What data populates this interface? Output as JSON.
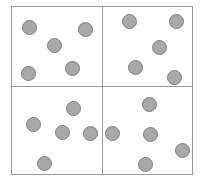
{
  "figure": {
    "title": "",
    "type": "quadrant-dot-diagram",
    "canvas": {
      "width": 204,
      "height": 180,
      "background_color": "#ffffff"
    },
    "frame": {
      "x": 11,
      "y": 6,
      "width": 182,
      "height": 169,
      "border_color": "#9a9a9a",
      "border_width": 1,
      "fill_color": "#ffffff"
    },
    "dividers": {
      "vertical_x": 102,
      "horizontal_y": 86,
      "color": "#9a9a9a",
      "width": 1
    },
    "dot_style": {
      "diameter": 15,
      "fill_color": "#a8a8a8",
      "stroke_color": "#808080",
      "stroke_width": 1
    },
    "total_dot_count": 20,
    "quadrants": [
      {
        "name": "top-left",
        "label": "Q1",
        "dot_count": 5,
        "dots": [
          {
            "cx": 29,
            "cy": 27
          },
          {
            "cx": 85,
            "cy": 29
          },
          {
            "cx": 54,
            "cy": 45
          },
          {
            "cx": 28,
            "cy": 73
          },
          {
            "cx": 72,
            "cy": 68
          }
        ]
      },
      {
        "name": "top-right",
        "label": "Q2",
        "dot_count": 5,
        "dots": [
          {
            "cx": 129,
            "cy": 21
          },
          {
            "cx": 176,
            "cy": 21
          },
          {
            "cx": 159,
            "cy": 47
          },
          {
            "cx": 135,
            "cy": 67
          },
          {
            "cx": 174,
            "cy": 77
          }
        ]
      },
      {
        "name": "bottom-left",
        "label": "Q3",
        "dot_count": 5,
        "dots": [
          {
            "cx": 73,
            "cy": 108
          },
          {
            "cx": 33,
            "cy": 124
          },
          {
            "cx": 62,
            "cy": 132
          },
          {
            "cx": 90,
            "cy": 133
          },
          {
            "cx": 44,
            "cy": 163
          }
        ]
      },
      {
        "name": "bottom-right",
        "label": "Q4",
        "dot_count": 5,
        "dots": [
          {
            "cx": 149,
            "cy": 104
          },
          {
            "cx": 112,
            "cy": 133
          },
          {
            "cx": 150,
            "cy": 134
          },
          {
            "cx": 182,
            "cy": 150
          },
          {
            "cx": 145,
            "cy": 164
          }
        ]
      }
    ]
  }
}
